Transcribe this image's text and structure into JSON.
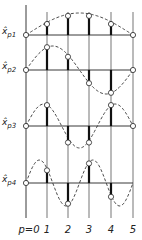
{
  "diagram": {
    "title": "",
    "p_axis_prefix": "p=",
    "p_values": [
      "0",
      "1",
      "2",
      "3",
      "4",
      "5"
    ],
    "rows": [
      {
        "label_main": "x̂",
        "label_sub": "p1",
        "values": [
          0,
          0.5,
          0.87,
          0.87,
          0.5,
          0
        ],
        "mode": 1,
        "end_marker": true
      },
      {
        "label_main": "x̂",
        "label_sub": "p2",
        "values": [
          0,
          0.95,
          0.55,
          -0.55,
          -0.95,
          0
        ],
        "mode": 2,
        "end_marker": true
      },
      {
        "label_main": "x̂",
        "label_sub": "p3",
        "values": [
          0,
          0.95,
          -0.75,
          -0.75,
          0.95,
          0
        ],
        "mode": 3,
        "end_marker": true
      },
      {
        "label_main": "x̂",
        "label_sub": "p4",
        "values": [
          0,
          0.55,
          -0.9,
          0.85,
          -0.6,
          0
        ],
        "mode": 4,
        "end_marker": false
      }
    ]
  }
}
